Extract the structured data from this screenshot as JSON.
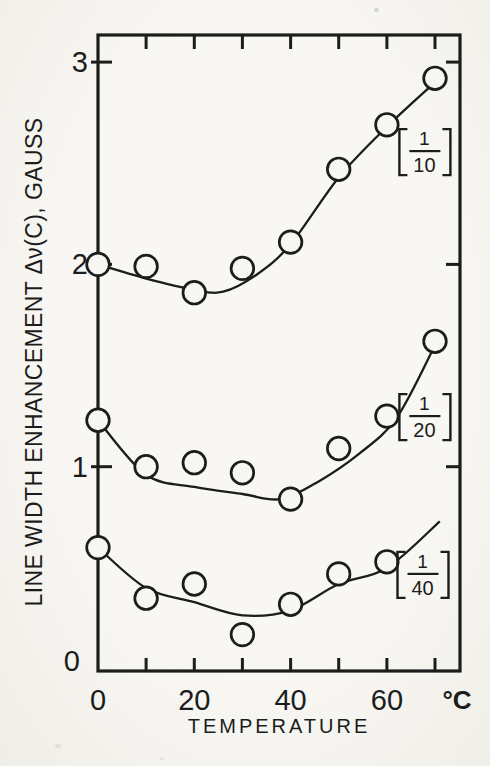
{
  "page": {
    "background": "#f6f5f0",
    "ink": "#1c1c1c"
  },
  "chart_data": {
    "type": "scatter",
    "title": "",
    "xlabel": "TEMPERATURE",
    "x_unit_label": "°C",
    "ylabel": "LINE WIDTH ENHANCEMENT  Δν(C), GAUSS",
    "xlim": [
      0,
      74
    ],
    "ylim": [
      0,
      3.15
    ],
    "grid": false,
    "marker": "open-circle",
    "x_tick_labels": [
      "0",
      "20",
      "40",
      "60"
    ],
    "x_tick_label_values": [
      0,
      20,
      40,
      60
    ],
    "x_minor_ticks": [
      10,
      20,
      30,
      40,
      50,
      60,
      70
    ],
    "y_ticks": [
      0,
      1,
      2,
      3
    ],
    "y_side_ticks": [
      1,
      2,
      3
    ],
    "series": [
      {
        "name": "[1/10]",
        "fraction": {
          "numerator": "1",
          "denominator": "10"
        },
        "x": [
          0,
          10,
          20,
          30,
          40,
          50,
          60,
          70
        ],
        "y": [
          2.0,
          1.99,
          1.86,
          1.98,
          2.11,
          2.47,
          2.69,
          2.92
        ],
        "curve": [
          [
            0,
            2.0
          ],
          [
            10,
            1.93
          ],
          [
            20,
            1.875
          ],
          [
            26,
            1.865
          ],
          [
            33,
            1.95
          ],
          [
            40,
            2.1
          ],
          [
            50,
            2.43
          ],
          [
            60,
            2.68
          ],
          [
            70,
            2.9
          ]
        ],
        "label_anchor": [
          67.8,
          2.56
        ]
      },
      {
        "name": "[1/20]",
        "fraction": {
          "numerator": "1",
          "denominator": "20"
        },
        "x": [
          0,
          10,
          20,
          30,
          40,
          50,
          60,
          70
        ],
        "y": [
          1.23,
          1.0,
          1.02,
          0.97,
          0.84,
          1.09,
          1.25,
          1.62
        ],
        "curve": [
          [
            0,
            1.23
          ],
          [
            10,
            0.96
          ],
          [
            20,
            0.9
          ],
          [
            30,
            0.865
          ],
          [
            38,
            0.84
          ],
          [
            46,
            0.93
          ],
          [
            54,
            1.06
          ],
          [
            62,
            1.24
          ],
          [
            70,
            1.6
          ]
        ],
        "label_anchor": [
          67.8,
          1.25
        ]
      },
      {
        "name": "[1/40]",
        "fraction": {
          "numerator": "1",
          "denominator": "40"
        },
        "x": [
          0,
          10,
          20,
          30,
          40,
          50,
          60
        ],
        "y": [
          0.6,
          0.35,
          0.42,
          0.17,
          0.32,
          0.47,
          0.53
        ],
        "curve": [
          [
            0,
            0.6
          ],
          [
            10,
            0.4
          ],
          [
            20,
            0.33
          ],
          [
            30,
            0.265
          ],
          [
            40,
            0.29
          ],
          [
            50,
            0.42
          ],
          [
            60,
            0.5
          ],
          [
            71,
            0.73
          ]
        ],
        "label_anchor": [
          67.4,
          0.47
        ]
      }
    ]
  }
}
